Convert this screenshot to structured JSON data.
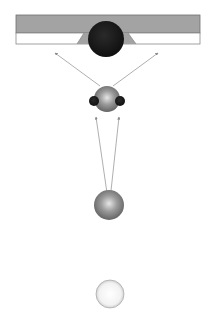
{
  "diagram": {
    "width": 210,
    "height": 321,
    "background": "#ffffff",
    "surface": {
      "x": 16,
      "y": 15,
      "width": 184,
      "top_height": 18,
      "strip_height": 11,
      "top_color": "#a3a3a3",
      "strip_color": "#ffffff",
      "border_color": "#6f6f6f"
    },
    "nodes": [
      {
        "id": "target-sphere",
        "cx": 106,
        "cy": 39,
        "r": 18,
        "fill": "#151515",
        "style": "dark"
      },
      {
        "id": "complex-sphere",
        "cx": 107,
        "cy": 99,
        "r": 13,
        "fill": "#8a8a8a",
        "style": "gray"
      },
      {
        "id": "satellite-left",
        "cx": 94,
        "cy": 101,
        "r": 5,
        "fill": "#1a1a1a",
        "style": "dark"
      },
      {
        "id": "satellite-right",
        "cx": 120,
        "cy": 101,
        "r": 5,
        "fill": "#1a1a1a",
        "style": "dark"
      },
      {
        "id": "source-sphere",
        "cx": 109,
        "cy": 205,
        "r": 15,
        "fill": "#7f7f7f",
        "style": "gray"
      },
      {
        "id": "empty-sphere",
        "cx": 110,
        "cy": 294,
        "r": 14,
        "fill": "#f2f2f2",
        "style": "light"
      }
    ],
    "arrows": [
      {
        "id": "arrow-up-left",
        "x1": 100,
        "y1": 86,
        "x2": 55,
        "y2": 53,
        "color": "#9a9a9a"
      },
      {
        "id": "arrow-up-right",
        "x1": 113,
        "y1": 86,
        "x2": 158,
        "y2": 53,
        "color": "#9a9a9a"
      },
      {
        "id": "line-left",
        "x1": 108,
        "y1": 200,
        "x2": 96,
        "y2": 117,
        "color": "#9a9a9a"
      },
      {
        "id": "line-right",
        "x1": 110,
        "y1": 200,
        "x2": 119,
        "y2": 117,
        "color": "#9a9a9a"
      }
    ]
  }
}
